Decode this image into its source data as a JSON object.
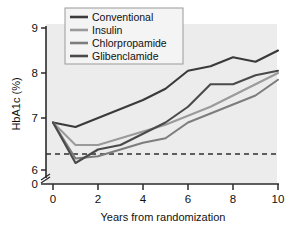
{
  "chart_data": {
    "type": "line",
    "title": "",
    "xlabel": "Years from randomization",
    "ylabel": "HbA1c (%)",
    "xlim": [
      0,
      10
    ],
    "ylim": [
      6,
      9
    ],
    "grid": false,
    "legend_position": "top-left",
    "x_ticks": [
      "0",
      "2",
      "4",
      "6",
      "8",
      "10"
    ],
    "x_tick_values": [
      0,
      2,
      4,
      6,
      8,
      10
    ],
    "y_ticks": [
      "9",
      "8",
      "7",
      "6",
      "0"
    ],
    "y_tick_values": [
      9,
      8,
      7,
      6
    ],
    "y_axis_break": true,
    "y_axis_break_label": "0",
    "x": [
      0,
      1,
      2,
      3,
      4,
      5,
      6,
      7,
      8,
      9,
      10
    ],
    "series": [
      {
        "name": "Conventional",
        "color": "#3a3a3a",
        "values": [
          6.9,
          6.8,
          7.0,
          7.2,
          7.4,
          7.65,
          8.05,
          8.15,
          8.35,
          8.25,
          8.5
        ]
      },
      {
        "name": "Insulin",
        "color": "#9a9a9a",
        "values": [
          6.9,
          6.4,
          6.4,
          6.55,
          6.7,
          6.85,
          7.05,
          7.25,
          7.5,
          7.75,
          8.0
        ]
      },
      {
        "name": "Chlorpropamide",
        "color": "#7d7d7d",
        "values": [
          6.9,
          6.1,
          6.15,
          6.3,
          6.45,
          6.55,
          6.9,
          7.1,
          7.3,
          7.5,
          7.85
        ]
      },
      {
        "name": "Glibenclamide",
        "color": "#4a4a4a",
        "values": [
          6.9,
          6.0,
          6.3,
          6.4,
          6.65,
          6.9,
          7.25,
          7.75,
          7.75,
          7.95,
          8.05
        ]
      }
    ],
    "reference_line": {
      "name": "target",
      "value": 6.2,
      "style": "dashed"
    }
  },
  "legend": {
    "items": [
      {
        "label": "Conventional"
      },
      {
        "label": "Insulin"
      },
      {
        "label": "Chlorpropamide"
      },
      {
        "label": "Glibenclamide"
      }
    ]
  }
}
